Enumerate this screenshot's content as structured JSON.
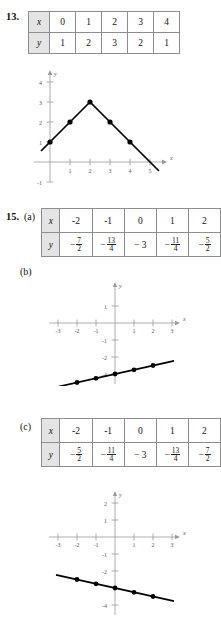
{
  "page": {
    "background": "#ffffff",
    "table_header_fill": "#e4e4e4",
    "axis_color": "#9a9a9a",
    "curve_color": "#000000"
  },
  "problem13": {
    "number": "13.",
    "table": {
      "row_labels": [
        "x",
        "y"
      ],
      "x": [
        "0",
        "1",
        "2",
        "3",
        "4"
      ],
      "y": [
        "1",
        "2",
        "3",
        "2",
        "1"
      ]
    },
    "graph": {
      "x_axis_name": "x",
      "y_axis_name": "y",
      "x_ticks": [
        "1",
        "2",
        "3",
        "4",
        "5"
      ],
      "y_ticks": [
        "4",
        "3",
        "2",
        "1",
        "-1"
      ],
      "points": [
        {
          "x": 0,
          "y": 1
        },
        {
          "x": 1,
          "y": 2
        },
        {
          "x": 2,
          "y": 3
        },
        {
          "x": 3,
          "y": 2
        },
        {
          "x": 4,
          "y": 1
        }
      ],
      "line_start": {
        "x": -0.45,
        "y": 0.55
      },
      "line_end": {
        "x": 5.45,
        "y": -0.45
      }
    }
  },
  "problem15": {
    "number": "15.",
    "parts": {
      "a": "(a)",
      "b": "(b)",
      "c": "(c)",
      "d": "(d)"
    },
    "table_a": {
      "row_labels": [
        "x",
        "y"
      ],
      "x": [
        "-2",
        "-1",
        "0",
        "1",
        "2"
      ],
      "y_display": [
        "-7/2",
        "-13/4",
        "-3",
        "-11/4",
        "-5/2"
      ],
      "y_cells": [
        {
          "sign": "−",
          "num": "7",
          "den": "2",
          "whole": ""
        },
        {
          "sign": "−",
          "num": "13",
          "den": "4",
          "whole": ""
        },
        {
          "sign": "−",
          "num": "",
          "den": "",
          "whole": "3"
        },
        {
          "sign": "−",
          "num": "11",
          "den": "4",
          "whole": ""
        },
        {
          "sign": "−",
          "num": "5",
          "den": "2",
          "whole": ""
        }
      ]
    },
    "graph_b": {
      "x_axis_name": "x",
      "y_axis_name": "y",
      "x_ticks": [
        "-3",
        "-2",
        "-1",
        "1",
        "2",
        "3"
      ],
      "y_ticks": [
        "1",
        "-1",
        "-2",
        "-4"
      ],
      "points": [
        {
          "x": -2,
          "y": -3.5
        },
        {
          "x": -1,
          "y": -3.25
        },
        {
          "x": 0,
          "y": -3
        },
        {
          "x": 1,
          "y": -2.75
        },
        {
          "x": 2,
          "y": -2.5
        }
      ],
      "line_start": {
        "x": -3.1,
        "y": -3.775
      },
      "line_end": {
        "x": 3.1,
        "y": -2.225
      }
    },
    "table_c": {
      "row_labels": [
        "x",
        "y"
      ],
      "x": [
        "-2",
        "-1",
        "0",
        "1",
        "2"
      ],
      "y_display": [
        "-5/2",
        "-11/4",
        "-3",
        "-13/4",
        "-7/2"
      ],
      "y_cells": [
        {
          "sign": "−",
          "num": "5",
          "den": "2",
          "whole": ""
        },
        {
          "sign": "−",
          "num": "11",
          "den": "4",
          "whole": ""
        },
        {
          "sign": "−",
          "num": "",
          "den": "",
          "whole": "3"
        },
        {
          "sign": "−",
          "num": "13",
          "den": "4",
          "whole": ""
        },
        {
          "sign": "−",
          "num": "7",
          "den": "2",
          "whole": ""
        }
      ]
    },
    "graph_d": {
      "x_axis_name": "x",
      "y_axis_name": "y",
      "x_ticks": [
        "-3",
        "-2",
        "-1",
        "1",
        "2",
        "3"
      ],
      "y_ticks": [
        "2",
        "1",
        "-1",
        "-2",
        "-4"
      ],
      "points": [
        {
          "x": -2,
          "y": -2.5
        },
        {
          "x": -1,
          "y": -2.75
        },
        {
          "x": 0,
          "y": -3
        },
        {
          "x": 1,
          "y": -3.25
        },
        {
          "x": 2,
          "y": -3.5
        }
      ],
      "line_start": {
        "x": -3.1,
        "y": -2.225
      },
      "line_end": {
        "x": 3.1,
        "y": -3.775
      }
    }
  }
}
